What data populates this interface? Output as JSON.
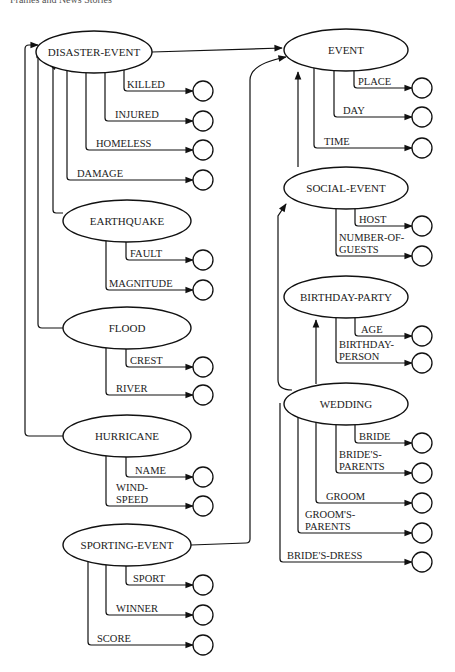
{
  "header": {
    "title": "Frames and News Stories",
    "page": ""
  },
  "frames": [
    {
      "id": "disaster-event",
      "label": "DISASTER-EVENT",
      "cx": 94,
      "cy": 52,
      "rx": 58,
      "ry": 21,
      "slots": [
        {
          "label": [
            "KILLED"
          ],
          "x0": 124,
          "y": 91,
          "lx": 127
        },
        {
          "label": [
            "INJURED"
          ],
          "x0": 105,
          "y": 121,
          "lx": 115
        },
        {
          "label": [
            "HOMELESS"
          ],
          "x0": 86,
          "y": 150,
          "lx": 96
        },
        {
          "label": [
            "DAMAGE"
          ],
          "x0": 67,
          "y": 180,
          "lx": 77
        }
      ]
    },
    {
      "id": "earthquake",
      "label": "EARTHQUAKE",
      "cx": 127,
      "cy": 221,
      "rx": 64,
      "ry": 21,
      "slots": [
        {
          "label": [
            "FAULT"
          ],
          "x0": 126,
          "y": 260,
          "lx": 130
        },
        {
          "label": [
            "MAGNITUDE"
          ],
          "x0": 106,
          "y": 290,
          "lx": 109
        }
      ]
    },
    {
      "id": "flood",
      "label": "FLOOD",
      "cx": 127,
      "cy": 328,
      "rx": 64,
      "ry": 21,
      "slots": [
        {
          "label": [
            "CREST"
          ],
          "x0": 126,
          "y": 367,
          "lx": 130
        },
        {
          "label": [
            "RIVER"
          ],
          "x0": 106,
          "y": 395,
          "lx": 116
        }
      ]
    },
    {
      "id": "hurricane",
      "label": "HURRICANE",
      "cx": 127,
      "cy": 436,
      "rx": 64,
      "ry": 21,
      "slots": [
        {
          "label": [
            "NAME"
          ],
          "x0": 126,
          "y": 477,
          "lx": 135
        },
        {
          "label": [
            "WIND-",
            "SPEED"
          ],
          "x0": 106,
          "y": 506,
          "lx": 116
        }
      ]
    },
    {
      "id": "sporting-event",
      "label": "SPORTING-EVENT",
      "cx": 127,
      "cy": 545,
      "rx": 64,
      "ry": 21,
      "slots": [
        {
          "label": [
            "SPORT"
          ],
          "x0": 126,
          "y": 585,
          "lx": 133
        },
        {
          "label": [
            "WINNER"
          ],
          "x0": 106,
          "y": 615,
          "lx": 116
        },
        {
          "label": [
            "SCORE"
          ],
          "x0": 88,
          "y": 645,
          "lx": 97
        }
      ]
    },
    {
      "id": "event",
      "label": "EVENT",
      "cx": 346,
      "cy": 50,
      "rx": 62,
      "ry": 21,
      "slots": [
        {
          "label": [
            "PLACE"
          ],
          "x0": 354,
          "y": 88,
          "lx": 358
        },
        {
          "label": [
            "DAY"
          ],
          "x0": 334,
          "y": 117,
          "lx": 343
        },
        {
          "label": [
            "TIME"
          ],
          "x0": 314,
          "y": 148,
          "lx": 324
        }
      ]
    },
    {
      "id": "social-event",
      "label": "SOCIAL-EVENT",
      "cx": 346,
      "cy": 188,
      "rx": 62,
      "ry": 21,
      "slots": [
        {
          "label": [
            "HOST"
          ],
          "x0": 355,
          "y": 226,
          "lx": 359
        },
        {
          "label": [
            "NUMBER-OF-",
            "GUESTS"
          ],
          "x0": 336,
          "y": 256,
          "lx": 339
        }
      ]
    },
    {
      "id": "birthday-party",
      "label": "BIRTHDAY-PARTY",
      "cx": 346,
      "cy": 297,
      "rx": 62,
      "ry": 21,
      "slots": [
        {
          "label": [
            "AGE"
          ],
          "x0": 355,
          "y": 336,
          "lx": 361
        },
        {
          "label": [
            "BIRTHDAY-",
            "PERSON"
          ],
          "x0": 336,
          "y": 363,
          "lx": 339
        }
      ]
    },
    {
      "id": "wedding",
      "label": "WEDDING",
      "cx": 346,
      "cy": 404,
      "rx": 62,
      "ry": 21,
      "slots": [
        {
          "label": [
            "BRIDE"
          ],
          "x0": 355,
          "y": 443,
          "lx": 359
        },
        {
          "label": [
            "BRIDE'S-",
            "PARENTS"
          ],
          "x0": 336,
          "y": 473,
          "lx": 339
        },
        {
          "label": [
            "GROOM"
          ],
          "x0": 316,
          "y": 503,
          "lx": 326
        },
        {
          "label": [
            "GROOM'S-",
            "PARENTS"
          ],
          "x0": 298,
          "y": 533,
          "lx": 305
        },
        {
          "label": [
            "BRIDE'S-DRESS"
          ],
          "x0": 280,
          "y": 562,
          "lx": 287
        }
      ]
    }
  ],
  "slot_circle": {
    "cx": 422,
    "r": 10
  },
  "left_slot_circle": {
    "cx": 203,
    "r": 10
  },
  "isa_links": [
    {
      "from": "EARTHQUAKE",
      "to": "DISASTER-EVENT"
    },
    {
      "from": "FLOOD",
      "to": "DISASTER-EVENT"
    },
    {
      "from": "HURRICANE",
      "to": "DISASTER-EVENT"
    },
    {
      "from": "DISASTER-EVENT",
      "to": "EVENT"
    },
    {
      "from": "SPORTING-EVENT",
      "to": "EVENT"
    },
    {
      "from": "SOCIAL-EVENT",
      "to": "EVENT"
    },
    {
      "from": "WEDDING",
      "to": "SOCIAL-EVENT"
    },
    {
      "from": "WEDDING",
      "to": "BIRTHDAY-PARTY"
    }
  ]
}
